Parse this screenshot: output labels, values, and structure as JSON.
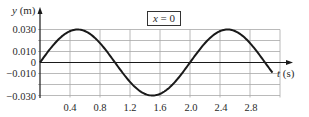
{
  "chart_data": {
    "type": "line",
    "title": "",
    "annotation": "x = 0",
    "annotation_parts": {
      "var": "x",
      "eq": " = 0"
    },
    "xlabel": "t (s)",
    "xlabel_parts": {
      "var": "t",
      "unit": " (s)"
    },
    "ylabel": "y (m)",
    "ylabel_parts": {
      "var": "y",
      "unit": " (m)"
    },
    "xlim": [
      0,
      3.2
    ],
    "ylim": [
      -0.03,
      0.03
    ],
    "x_ticks": [
      0.4,
      0.8,
      1.2,
      1.6,
      2.0,
      2.4,
      2.8
    ],
    "x_tick_labels": [
      "0.4",
      "0.8",
      "1.2",
      "1.6",
      "2.0",
      "2.4",
      "2.8"
    ],
    "y_ticks": [
      0.03,
      0.01,
      0,
      -0.01,
      -0.03
    ],
    "y_tick_labels": [
      "0.030",
      "0.010",
      "0",
      "−0.010",
      "−0.030"
    ],
    "y_gridlines": [
      0.03,
      0.02,
      0.01,
      0,
      -0.01,
      -0.02,
      -0.03
    ],
    "grid": true,
    "legend": null,
    "series": [
      {
        "name": "y(t) at x = 0",
        "equation": "y = 0.030 sin(π t)",
        "amplitude": 0.03,
        "period": 2.0,
        "x": [
          0,
          0.25,
          0.5,
          0.75,
          1.0,
          1.25,
          1.5,
          1.75,
          2.0,
          2.25,
          2.5,
          2.75,
          3.0,
          3.1
        ],
        "values": [
          0,
          0.0212,
          0.03,
          0.0212,
          0,
          -0.0212,
          -0.03,
          -0.0212,
          0,
          0.0212,
          0.03,
          0.0212,
          0,
          -0.0093
        ]
      }
    ],
    "colors": {
      "curve": "#1a1a1a",
      "grid": "#9a9a9a",
      "axis": "#1a1a1a",
      "text": "#2a2a2a"
    }
  }
}
